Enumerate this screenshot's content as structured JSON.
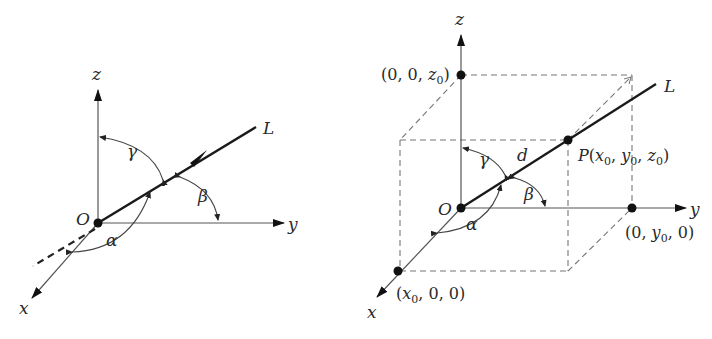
{
  "figure": {
    "left_panel": {
      "title": "Direction angles of line L through origin",
      "origin_label": "O",
      "axes": {
        "x": "x",
        "y": "y",
        "z": "z"
      },
      "line_label": "L",
      "angles": {
        "alpha": "α",
        "beta": "β",
        "gamma": "γ"
      }
    },
    "right_panel": {
      "title": "Line L through origin and point P",
      "origin_label": "O",
      "axes": {
        "x": "x",
        "y": "y",
        "z": "z"
      },
      "line_label": "L",
      "distance_label": "d",
      "angles": {
        "alpha": "α",
        "beta": "β",
        "gamma": "γ"
      },
      "points": {
        "P": {
          "name": "P",
          "coords": "(x0, y0, z0)"
        },
        "x_point": {
          "coords": "(x0, 0, 0)"
        },
        "y_point": {
          "coords": "(0, y0, 0)"
        },
        "z_point": {
          "coords": "(0, 0, z0)"
        }
      }
    }
  }
}
